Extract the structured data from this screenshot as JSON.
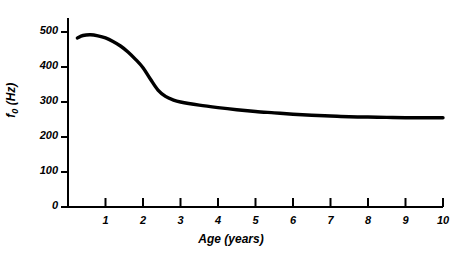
{
  "chart_data": {
    "type": "line",
    "title": "",
    "subtitle": "",
    "xlabel": "Age (years)",
    "ylabel": "f0 (Hz)",
    "ylabel_base": "f",
    "ylabel_sub": "0",
    "ylabel_unit": " (Hz)",
    "xlim": [
      0,
      10
    ],
    "ylim": [
      0,
      540
    ],
    "grid": false,
    "legend": "none",
    "x_ticks": [
      1,
      2,
      3,
      4,
      5,
      6,
      7,
      8,
      9,
      10
    ],
    "x_tick_labels": [
      "1",
      "2",
      "3",
      "4",
      "5",
      "6",
      "7",
      "8",
      "9",
      "10"
    ],
    "y_ticks": [
      0,
      100,
      200,
      300,
      400,
      500
    ],
    "y_tick_labels": [
      "0",
      "100",
      "200",
      "300",
      "400",
      "500"
    ],
    "line_color": "#000000",
    "line_width_px": 3.4,
    "axis_color": "#000000",
    "background": "#ffffff",
    "series": [
      {
        "name": "Fundamental frequency vs age",
        "x": [
          0.25,
          0.4,
          0.6,
          0.8,
          1.0,
          1.2,
          1.4,
          1.6,
          1.8,
          2.0,
          2.2,
          2.4,
          2.6,
          2.8,
          3.0,
          3.5,
          4.0,
          4.5,
          5.0,
          5.5,
          6.0,
          6.5,
          7.0,
          7.5,
          8.0,
          8.5,
          9.0,
          9.5,
          10.0
        ],
        "y": [
          483,
          490,
          492,
          489,
          483,
          473,
          460,
          443,
          422,
          398,
          365,
          334,
          316,
          306,
          300,
          291,
          284,
          278,
          273,
          269,
          265,
          262,
          260,
          258,
          257,
          256,
          255,
          255,
          255
        ]
      }
    ],
    "annotations": []
  },
  "axes_geometry": {
    "plot_left_px": 68,
    "plot_right_px": 443,
    "plot_bottom_px": 207,
    "plot_top_px": 18,
    "x_per_year_px": 37.5,
    "y_per_100hz_px": 35
  }
}
